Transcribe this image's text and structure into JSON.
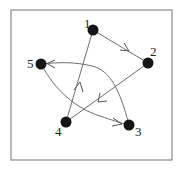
{
  "diagram": {
    "type": "directed-graph",
    "frame": {
      "x": 11,
      "y": 10,
      "width": 161,
      "height": 150
    },
    "colors": {
      "node": "#151515",
      "edge": "#6e6e6e",
      "frame": "#8a8a8a",
      "label": "#222222"
    },
    "nodes": [
      {
        "id": "1",
        "label": "1",
        "x": 93,
        "y": 30,
        "label_x": 84,
        "label_y": 28
      },
      {
        "id": "2",
        "label": "2",
        "x": 148,
        "y": 63,
        "label_x": 150,
        "label_y": 56
      },
      {
        "id": "3",
        "label": "3",
        "x": 129,
        "y": 125,
        "label_x": 135,
        "label_y": 136
      },
      {
        "id": "4",
        "label": "4",
        "x": 66,
        "y": 122,
        "label_x": 55,
        "label_y": 136
      },
      {
        "id": "5",
        "label": "5",
        "x": 41,
        "y": 64,
        "label_x": 27,
        "label_y": 68
      }
    ],
    "edges": [
      {
        "from": "1",
        "to": "2",
        "shape": "straight"
      },
      {
        "from": "2",
        "to": "4",
        "shape": "straight"
      },
      {
        "from": "4",
        "to": "1",
        "shape": "straight"
      },
      {
        "from": "5",
        "to": "3",
        "shape": "curved"
      },
      {
        "from": "3",
        "to": "5",
        "shape": "curved"
      }
    ]
  }
}
